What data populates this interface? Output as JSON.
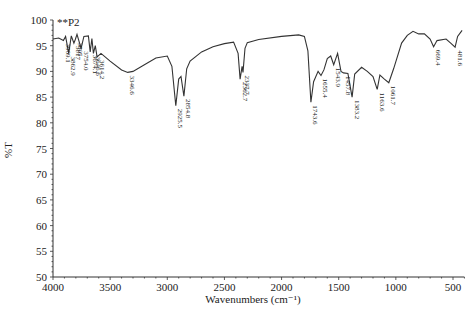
{
  "chart_data": {
    "type": "line",
    "title": "**P2",
    "xlabel": "Wavenumbers (cm⁻¹)",
    "ylabel": "%T",
    "xlim": [
      4000,
      400
    ],
    "ylim": [
      50,
      100
    ],
    "x_ticks": [
      4000,
      3500,
      3000,
      2500,
      2000,
      1500,
      1000,
      500
    ],
    "y_ticks": [
      50,
      55,
      60,
      65,
      70,
      75,
      80,
      85,
      90,
      95,
      100
    ],
    "grid": false,
    "series": [
      {
        "name": "**P2",
        "points": [
          [
            4000,
            96.3
          ],
          [
            3950,
            96.5
          ],
          [
            3909.1,
            96.0
          ],
          [
            3890,
            96.8
          ],
          [
            3862.9,
            93.5
          ],
          [
            3840,
            96.9
          ],
          [
            3817,
            95.5
          ],
          [
            3805,
            96.2
          ],
          [
            3790,
            97.2
          ],
          [
            3754,
            94.5
          ],
          [
            3730,
            96.8
          ],
          [
            3690,
            96.9
          ],
          [
            3674.1,
            93.8
          ],
          [
            3660,
            96.4
          ],
          [
            3646.6,
            93.5
          ],
          [
            3630,
            95.0
          ],
          [
            3614.2,
            92.8
          ],
          [
            3580,
            93.5
          ],
          [
            3500,
            92.0
          ],
          [
            3400,
            90.3
          ],
          [
            3346.6,
            89.8
          ],
          [
            3300,
            90.0
          ],
          [
            3200,
            91.3
          ],
          [
            3100,
            92.6
          ],
          [
            3000,
            93.0
          ],
          [
            2960,
            91.0
          ],
          [
            2925.5,
            83.3
          ],
          [
            2900,
            88.5
          ],
          [
            2880,
            89.0
          ],
          [
            2854.8,
            85.2
          ],
          [
            2830,
            90.5
          ],
          [
            2800,
            92.0
          ],
          [
            2700,
            93.8
          ],
          [
            2600,
            94.8
          ],
          [
            2500,
            95.4
          ],
          [
            2420,
            95.7
          ],
          [
            2380,
            93.5
          ],
          [
            2362.7,
            88.5
          ],
          [
            2345,
            91.0
          ],
          [
            2337.7,
            89.8
          ],
          [
            2320,
            94.5
          ],
          [
            2300,
            95.6
          ],
          [
            2200,
            96.2
          ],
          [
            2000,
            96.8
          ],
          [
            1850,
            97.1
          ],
          [
            1800,
            96.8
          ],
          [
            1770,
            94.0
          ],
          [
            1743.6,
            84.0
          ],
          [
            1720,
            88.0
          ],
          [
            1680,
            90.0
          ],
          [
            1655.4,
            89.2
          ],
          [
            1630,
            90.3
          ],
          [
            1600,
            92.5
          ],
          [
            1570,
            93.0
          ],
          [
            1543.9,
            91.3
          ],
          [
            1510,
            93.5
          ],
          [
            1480,
            90.0
          ],
          [
            1457.8,
            89.7
          ],
          [
            1420,
            89.6
          ],
          [
            1383.2,
            85.0
          ],
          [
            1360,
            89.5
          ],
          [
            1300,
            90.8
          ],
          [
            1250,
            90.0
          ],
          [
            1200,
            89.0
          ],
          [
            1163.6,
            86.5
          ],
          [
            1140,
            89.3
          ],
          [
            1100,
            88.5
          ],
          [
            1061.7,
            87.8
          ],
          [
            1020,
            90.5
          ],
          [
            950,
            95.5
          ],
          [
            900,
            97.0
          ],
          [
            850,
            97.8
          ],
          [
            800,
            97.3
          ],
          [
            750,
            97.3
          ],
          [
            700,
            96.3
          ],
          [
            669.4,
            94.8
          ],
          [
            640,
            96.0
          ],
          [
            560,
            96.3
          ],
          [
            520,
            95.5
          ],
          [
            481.6,
            94.7
          ],
          [
            460,
            96.8
          ],
          [
            420,
            98.0
          ]
        ]
      }
    ],
    "annotations": [
      {
        "label": "3909.1",
        "x": 3909.1
      },
      {
        "label": "3862.9",
        "x": 3862.9
      },
      {
        "label": "3817",
        "x": 3817
      },
      {
        "label": "3805",
        "x": 3805
      },
      {
        "label": "3754.0",
        "x": 3754
      },
      {
        "label": "3674.1",
        "x": 3674.1
      },
      {
        "label": "3646.6",
        "x": 3646.6
      },
      {
        "label": "3614.2",
        "x": 3614.2
      },
      {
        "label": "3346.6",
        "x": 3346.6
      },
      {
        "label": "2925.5",
        "x": 2925.5
      },
      {
        "label": "2854.8",
        "x": 2854.8
      },
      {
        "label": "2362.7",
        "x": 2362.7
      },
      {
        "label": "2337.7",
        "x": 2337.7
      },
      {
        "label": "1743.6",
        "x": 1743.6
      },
      {
        "label": "1655.4",
        "x": 1655.4
      },
      {
        "label": "1543.9",
        "x": 1543.9
      },
      {
        "label": "1457.8",
        "x": 1457.8
      },
      {
        "label": "1383.2",
        "x": 1383.2
      },
      {
        "label": "1163.6",
        "x": 1163.6
      },
      {
        "label": "1061.7",
        "x": 1061.7
      },
      {
        "label": "669.4",
        "x": 669.4
      },
      {
        "label": "481.6",
        "x": 481.6
      }
    ]
  }
}
